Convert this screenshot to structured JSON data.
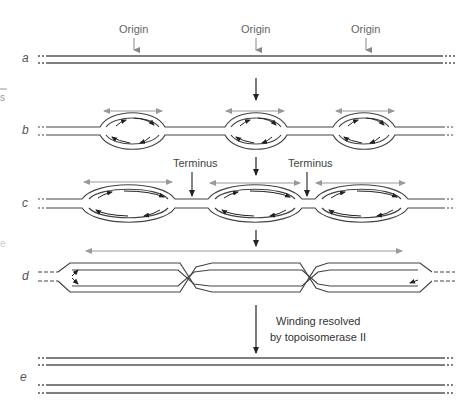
{
  "figure": {
    "rows": [
      {
        "id": "a",
        "label": "a",
        "description": "Unreplicated parental DNA duplex with three origins"
      },
      {
        "id": "b",
        "label": "b",
        "description": "Replication bubbles initiated at each origin"
      },
      {
        "id": "c",
        "label": "c",
        "description": "Bubbles enlarge; forks meet at termini"
      },
      {
        "id": "d",
        "label": "d",
        "description": "Replicated daughter duplexes remain intertwined"
      },
      {
        "id": "e",
        "label": "e",
        "description": "Two separated daughter duplexes"
      }
    ],
    "annotations": {
      "origin_labels": [
        "Origin",
        "Origin",
        "Origin"
      ],
      "terminus_labels": [
        "Terminus",
        "Terminus"
      ],
      "resolution_note_line1": "Winding resolved",
      "resolution_note_line2": "by topoisomerase II"
    },
    "left_edge_fragments": [
      "—",
      "s",
      "e"
    ],
    "colors": {
      "strand": "#444444",
      "fork_arrow": "#222222",
      "extent_arrow": "#999999",
      "origin_arrow": "#888888",
      "label_text": "#666666"
    }
  }
}
